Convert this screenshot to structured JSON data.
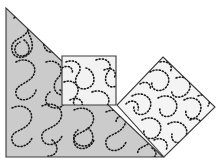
{
  "figure": {
    "width": 223,
    "height": 166,
    "background_color": "#ffffff",
    "outline_color": "#3a3a3a",
    "stipple_color": "#1a1a1a",
    "shapes": [
      {
        "id": "triangle",
        "name": "gray-right-triangle",
        "label": "Right triangle",
        "fill_color": "#cbcbcb",
        "points": "6,8 6,157 163,157",
        "stipple_clip": "clip-triangle"
      },
      {
        "id": "square-upright",
        "name": "upright-light-square",
        "label": "Upright square",
        "fill_color": "#f2f2f2",
        "points": "62,56 116,56 116,105 62,105",
        "stipple_clip": "clip-square-upright"
      },
      {
        "id": "square-rotated",
        "name": "rotated-light-square",
        "label": "Rotated square",
        "fill_color": "#f4f4f4",
        "points": "163,57 215,107 164,157 117,105",
        "stipple_clip": "clip-square-rotated"
      }
    ],
    "stipple_pattern": {
      "style": "dotted-meander",
      "dot_radius": 0.85,
      "dash_pattern": "1.1 2.1",
      "stroke_width": 1.6
    }
  }
}
